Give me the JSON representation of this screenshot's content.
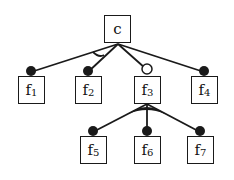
{
  "diagram": {
    "type": "feature-model-tree",
    "root": {
      "id": "c",
      "label": "c"
    },
    "nodes": [
      {
        "id": "f1",
        "base": "f",
        "sub": "1",
        "parent": "c",
        "connector": "mandatory-filled-dot"
      },
      {
        "id": "f2",
        "base": "f",
        "sub": "2",
        "parent": "c",
        "connector": "mandatory-filled-dot"
      },
      {
        "id": "f3",
        "base": "f",
        "sub": "3",
        "parent": "c",
        "connector": "optional-hollow-dot"
      },
      {
        "id": "f4",
        "base": "f",
        "sub": "4",
        "parent": "c",
        "connector": "mandatory-filled-dot"
      },
      {
        "id": "f5",
        "base": "f",
        "sub": "5",
        "parent": "f3",
        "connector": "filled-dot"
      },
      {
        "id": "f6",
        "base": "f",
        "sub": "6",
        "parent": "f3",
        "connector": "filled-dot"
      },
      {
        "id": "f7",
        "base": "f",
        "sub": "7",
        "parent": "f3",
        "connector": "filled-dot"
      }
    ],
    "groups": [
      {
        "parent": "c",
        "children": [
          "f1",
          "f2"
        ],
        "kind": "alternative-hollow-arc"
      },
      {
        "parent": "f3",
        "children": [
          "f5",
          "f6",
          "f7"
        ],
        "kind": "or-filled-arc"
      }
    ]
  }
}
